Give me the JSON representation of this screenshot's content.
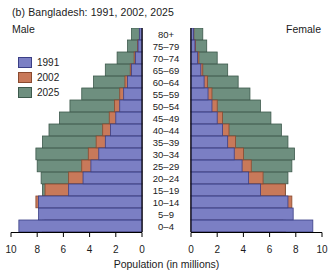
{
  "title": "(b) Bangladesh: 1991, 2002, 2025",
  "male_label": "Male",
  "female_label": "Female",
  "xlabel": "Population (in millions)",
  "legend": [
    {
      "label": "1991",
      "color": "#7b7fc4"
    },
    {
      "label": "2002",
      "color": "#c8795a"
    },
    {
      "label": "2025",
      "color": "#6e8f7f"
    }
  ],
  "colors": {
    "y1991_fill": "#7b7fc4",
    "y1991_stroke": "#3b3f86",
    "y2002_fill": "#c8795a",
    "y2002_stroke": "#8a4a2f",
    "y2025_fill": "#6e8f7f",
    "y2025_stroke": "#3d594c",
    "axis": "#000000"
  },
  "chart_data": {
    "type": "bar",
    "subtype": "population-pyramid",
    "title": "(b) Bangladesh: 1991, 2002, 2025",
    "xlabel": "Population (in millions)",
    "ylabel": "",
    "xlim": [
      0,
      10
    ],
    "tick_values": [
      10,
      8,
      6,
      4,
      2,
      0,
      0,
      2,
      4,
      6,
      8,
      10
    ],
    "left_ticks": [
      10,
      8,
      6,
      4,
      2,
      0
    ],
    "right_ticks": [
      0,
      2,
      4,
      6,
      8,
      10
    ],
    "grid": false,
    "legend_position": "left",
    "categories": [
      "0–4",
      "5–9",
      "10–14",
      "15–19",
      "20–24",
      "25–29",
      "30–34",
      "35–39",
      "40–44",
      "45–49",
      "50–54",
      "55–59",
      "60–64",
      "65–69",
      "70–74",
      "75–79",
      "80+"
    ],
    "series": [
      {
        "name": "1991",
        "side": "male",
        "values": [
          9.4,
          7.9,
          7.9,
          5.6,
          4.5,
          3.9,
          3.3,
          2.8,
          2.4,
          2.0,
          1.7,
          1.4,
          1.1,
          0.8,
          0.5,
          0.3,
          0.2
        ]
      },
      {
        "name": "2002",
        "side": "male",
        "values": [
          7.6,
          7.4,
          8.1,
          7.4,
          5.6,
          4.6,
          4.1,
          3.5,
          3.0,
          2.5,
          2.1,
          1.7,
          1.3,
          0.9,
          0.6,
          0.35,
          0.2
        ]
      },
      {
        "name": "2025",
        "side": "male",
        "values": [
          7.3,
          7.4,
          7.5,
          7.6,
          7.7,
          8.0,
          8.1,
          7.6,
          7.1,
          6.3,
          5.5,
          4.6,
          3.7,
          2.8,
          1.9,
          1.1,
          0.8
        ]
      },
      {
        "name": "1991",
        "side": "female",
        "values": [
          9.3,
          7.8,
          7.4,
          5.3,
          4.4,
          3.9,
          3.3,
          2.8,
          2.4,
          2.0,
          1.6,
          1.3,
          1.0,
          0.75,
          0.5,
          0.3,
          0.2
        ]
      },
      {
        "name": "2002",
        "side": "female",
        "values": [
          7.2,
          7.0,
          7.7,
          7.2,
          5.5,
          4.6,
          4.0,
          3.4,
          2.9,
          2.4,
          2.0,
          1.6,
          1.25,
          0.9,
          0.6,
          0.35,
          0.22
        ]
      },
      {
        "name": "2025",
        "side": "female",
        "values": [
          6.9,
          7.0,
          7.1,
          7.2,
          7.4,
          7.7,
          7.9,
          7.4,
          6.9,
          6.1,
          5.3,
          4.5,
          3.6,
          2.8,
          2.0,
          1.2,
          0.9
        ]
      }
    ]
  }
}
